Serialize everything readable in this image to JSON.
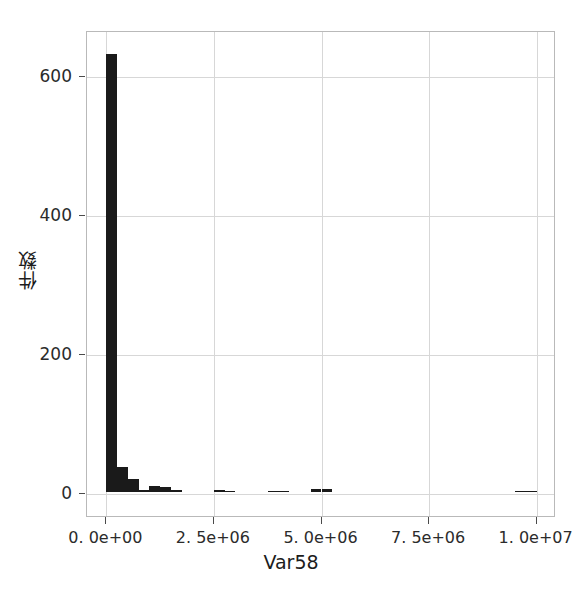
{
  "chart_data": {
    "type": "bar",
    "title": "",
    "subtitle": "",
    "xlabel": "Var58",
    "ylabel": "件数",
    "xlim": [
      -450000,
      10450000
    ],
    "ylim": [
      -35,
      665
    ],
    "grid": true,
    "legend": null,
    "legend_position": "none",
    "bar_color": "#1a1a1a",
    "x_tick_values": [
      0,
      2500000,
      5000000,
      7500000,
      10000000
    ],
    "x_tick_labels": [
      "0. 0e+00",
      "2. 5e+06",
      "5. 0e+06",
      "7. 5e+06",
      "1. 0e+07"
    ],
    "y_tick_values": [
      0,
      200,
      400,
      600
    ],
    "y_tick_labels": [
      "0",
      "200",
      "400",
      "600"
    ],
    "bin_width": 250000,
    "bins": [
      {
        "x0": 0,
        "x1": 250000,
        "count": 631
      },
      {
        "x0": 250000,
        "x1": 500000,
        "count": 35
      },
      {
        "x0": 500000,
        "x1": 750000,
        "count": 18
      },
      {
        "x0": 750000,
        "x1": 1000000,
        "count": 3
      },
      {
        "x0": 1000000,
        "x1": 1250000,
        "count": 8
      },
      {
        "x0": 1250000,
        "x1": 1500000,
        "count": 7
      },
      {
        "x0": 1500000,
        "x1": 1750000,
        "count": 2
      },
      {
        "x0": 1750000,
        "x1": 2000000,
        "count": 0
      },
      {
        "x0": 2000000,
        "x1": 2250000,
        "count": 0
      },
      {
        "x0": 2250000,
        "x1": 2500000,
        "count": 0
      },
      {
        "x0": 2500000,
        "x1": 2750000,
        "count": 2
      },
      {
        "x0": 2750000,
        "x1": 3000000,
        "count": 1
      },
      {
        "x0": 3000000,
        "x1": 3250000,
        "count": 0
      },
      {
        "x0": 3250000,
        "x1": 3500000,
        "count": 0
      },
      {
        "x0": 3500000,
        "x1": 3750000,
        "count": 0
      },
      {
        "x0": 3750000,
        "x1": 4000000,
        "count": 1
      },
      {
        "x0": 4000000,
        "x1": 4250000,
        "count": 1
      },
      {
        "x0": 4250000,
        "x1": 4500000,
        "count": 0
      },
      {
        "x0": 4500000,
        "x1": 4750000,
        "count": 0
      },
      {
        "x0": 4750000,
        "x1": 5000000,
        "count": 4
      },
      {
        "x0": 5000000,
        "x1": 5250000,
        "count": 4
      },
      {
        "x0": 5250000,
        "x1": 5500000,
        "count": 0
      },
      {
        "x0": 5500000,
        "x1": 5750000,
        "count": 0
      },
      {
        "x0": 5750000,
        "x1": 6000000,
        "count": 0
      },
      {
        "x0": 6000000,
        "x1": 6250000,
        "count": 0
      },
      {
        "x0": 6250000,
        "x1": 6500000,
        "count": 0
      },
      {
        "x0": 6500000,
        "x1": 6750000,
        "count": 0
      },
      {
        "x0": 6750000,
        "x1": 7000000,
        "count": 0
      },
      {
        "x0": 7000000,
        "x1": 7250000,
        "count": 0
      },
      {
        "x0": 7250000,
        "x1": 7500000,
        "count": 0
      },
      {
        "x0": 7500000,
        "x1": 7750000,
        "count": 0
      },
      {
        "x0": 7750000,
        "x1": 8000000,
        "count": 0
      },
      {
        "x0": 8000000,
        "x1": 8250000,
        "count": 0
      },
      {
        "x0": 8250000,
        "x1": 8500000,
        "count": 0
      },
      {
        "x0": 8500000,
        "x1": 8750000,
        "count": 0
      },
      {
        "x0": 8750000,
        "x1": 9000000,
        "count": 0
      },
      {
        "x0": 9000000,
        "x1": 9250000,
        "count": 0
      },
      {
        "x0": 9250000,
        "x1": 9500000,
        "count": 0
      },
      {
        "x0": 9500000,
        "x1": 9750000,
        "count": 1
      },
      {
        "x0": 9750000,
        "x1": 10000000,
        "count": 1
      }
    ]
  }
}
